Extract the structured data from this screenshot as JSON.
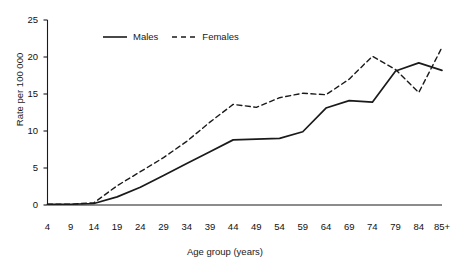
{
  "chart_data": {
    "type": "line",
    "title": "",
    "xlabel": "Age group (years)",
    "ylabel": "Rate per 100 000",
    "categories": [
      "4",
      "9",
      "14",
      "19",
      "24",
      "29",
      "34",
      "39",
      "44",
      "49",
      "54",
      "59",
      "64",
      "69",
      "74",
      "79",
      "84",
      "85+"
    ],
    "xtick_labels": [
      "4",
      "9",
      "14",
      "19",
      "24",
      "29",
      "34",
      "39",
      "44",
      "49",
      "54",
      "59",
      "64",
      "69",
      "74",
      "79",
      "84",
      "85+"
    ],
    "ytick_labels": [
      "0",
      "5",
      "10",
      "15",
      "20",
      "25"
    ],
    "ytick_values": [
      0,
      5,
      10,
      15,
      20,
      25
    ],
    "ylim": [
      0,
      25
    ],
    "grid": false,
    "legend_position": "top-left-inside",
    "series": [
      {
        "name": "Males",
        "style": "solid",
        "color": "#1a1a1a",
        "values": [
          0.1,
          0.1,
          0.2,
          1.1,
          2.4,
          4.0,
          5.6,
          7.2,
          8.8,
          8.9,
          9.0,
          9.9,
          13.1,
          14.1,
          13.9,
          18.1,
          19.2,
          18.2
        ]
      },
      {
        "name": "Females",
        "style": "dashed",
        "color": "#1a1a1a",
        "values": [
          0.1,
          0.1,
          0.3,
          2.6,
          4.5,
          6.4,
          8.6,
          11.2,
          13.6,
          13.2,
          14.5,
          15.1,
          14.9,
          17.0,
          20.1,
          18.3,
          15.2,
          21.3
        ]
      }
    ]
  },
  "legend": {
    "items": [
      {
        "label": "Males",
        "style": "solid"
      },
      {
        "label": "Females",
        "style": "dashed"
      }
    ]
  }
}
